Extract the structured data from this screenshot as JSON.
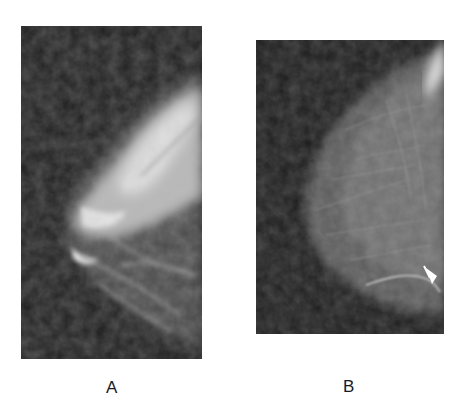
{
  "figure": {
    "panels": [
      {
        "id": "A",
        "label": "A",
        "description": "Mammogram, mediolateral view with dense fibroglandular tissue",
        "background_color": "#1e1e1e",
        "tissue_color": "#d8d8d8"
      },
      {
        "id": "B",
        "label": "B",
        "description": "Mammogram, craniocaudal view with predominantly fatty tissue; white arrow pointing to a bright lesion at the lower right",
        "background_color": "#1c1c1c",
        "tissue_color": "#6a6a6a",
        "annotation": "arrow-icon"
      }
    ]
  }
}
